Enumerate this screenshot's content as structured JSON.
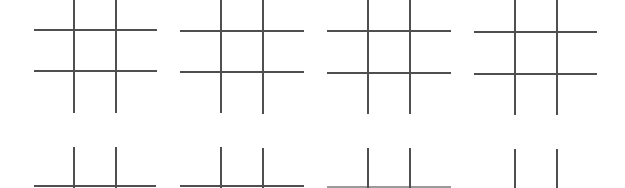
{
  "page": {
    "line_color": "#4f4f4f",
    "background": "#ffffff"
  },
  "boards": [
    {
      "id": "top-1",
      "row": 1,
      "col": 1,
      "horizontals": [
        {
          "x1": 34,
          "x2": 157,
          "y": 30
        },
        {
          "x1": 34,
          "x2": 157,
          "y": 71
        }
      ],
      "verticals": [
        {
          "x": 73,
          "y1": 0,
          "y2": 113
        },
        {
          "x": 115,
          "y1": 0,
          "y2": 113
        }
      ]
    },
    {
      "id": "top-2",
      "row": 1,
      "col": 2,
      "horizontals": [
        {
          "x1": 180,
          "x2": 304,
          "y": 31
        },
        {
          "x1": 180,
          "x2": 304,
          "y": 72
        }
      ],
      "verticals": [
        {
          "x": 220,
          "y1": 0,
          "y2": 113
        },
        {
          "x": 262,
          "y1": 0,
          "y2": 114
        }
      ]
    },
    {
      "id": "top-3",
      "row": 1,
      "col": 3,
      "horizontals": [
        {
          "x1": 327,
          "x2": 451,
          "y": 31
        },
        {
          "x1": 327,
          "x2": 451,
          "y": 73
        }
      ],
      "verticals": [
        {
          "x": 367,
          "y1": 0,
          "y2": 114
        },
        {
          "x": 409,
          "y1": 0,
          "y2": 114
        }
      ]
    },
    {
      "id": "top-4",
      "row": 1,
      "col": 4,
      "horizontals": [
        {
          "x1": 474,
          "x2": 597,
          "y": 32
        },
        {
          "x1": 474,
          "x2": 597,
          "y": 74
        }
      ],
      "verticals": [
        {
          "x": 514,
          "y1": 0,
          "y2": 115
        },
        {
          "x": 556,
          "y1": 0,
          "y2": 115
        }
      ]
    },
    {
      "id": "bottom-1",
      "row": 2,
      "col": 1,
      "horizontals": [
        {
          "x1": 34,
          "x2": 156,
          "y": 186
        }
      ],
      "verticals": [
        {
          "x": 73,
          "y1": 147,
          "y2": 188
        },
        {
          "x": 115,
          "y1": 147,
          "y2": 188
        }
      ]
    },
    {
      "id": "bottom-2",
      "row": 2,
      "col": 2,
      "horizontals": [
        {
          "x1": 180,
          "x2": 304,
          "y": 186
        }
      ],
      "verticals": [
        {
          "x": 220,
          "y1": 147,
          "y2": 188
        },
        {
          "x": 262,
          "y1": 148,
          "y2": 188
        }
      ]
    },
    {
      "id": "bottom-3",
      "row": 2,
      "col": 3,
      "horizontals": [
        {
          "x1": 327,
          "x2": 451,
          "y": 187,
          "faint": true
        }
      ],
      "verticals": [
        {
          "x": 367,
          "y1": 148,
          "y2": 188
        },
        {
          "x": 409,
          "y1": 148,
          "y2": 188
        }
      ]
    },
    {
      "id": "bottom-4",
      "row": 2,
      "col": 4,
      "horizontals": [],
      "verticals": [
        {
          "x": 514,
          "y1": 149,
          "y2": 188
        },
        {
          "x": 556,
          "y1": 149,
          "y2": 188
        }
      ]
    }
  ]
}
